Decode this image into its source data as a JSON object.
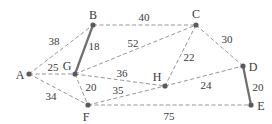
{
  "nodes": [
    {
      "id": "A",
      "x": 29,
      "y": 74,
      "lx": 20,
      "ly": 75
    },
    {
      "id": "B",
      "x": 93,
      "y": 25,
      "lx": 93,
      "ly": 15
    },
    {
      "id": "C",
      "x": 196,
      "y": 25,
      "lx": 196,
      "ly": 14
    },
    {
      "id": "D",
      "x": 243,
      "y": 66,
      "lx": 253,
      "ly": 67
    },
    {
      "id": "E",
      "x": 251,
      "y": 105,
      "lx": 261,
      "ly": 106
    },
    {
      "id": "F",
      "x": 88,
      "y": 105,
      "lx": 86,
      "ly": 117
    },
    {
      "id": "G",
      "x": 75,
      "y": 74,
      "lx": 67,
      "ly": 66
    },
    {
      "id": "H",
      "x": 165,
      "y": 86,
      "lx": 157,
      "ly": 77
    }
  ],
  "edges": [
    {
      "from": "A",
      "to": "B",
      "weight": "38",
      "style": "dashed",
      "lx": 54,
      "ly": 41
    },
    {
      "from": "A",
      "to": "G",
      "weight": "25",
      "style": "dashed",
      "lx": 53,
      "ly": 67
    },
    {
      "from": "A",
      "to": "F",
      "weight": "34",
      "style": "dashed",
      "lx": 51,
      "ly": 96
    },
    {
      "from": "B",
      "to": "G",
      "weight": "18",
      "style": "solid",
      "lx": 94,
      "ly": 46
    },
    {
      "from": "B",
      "to": "C",
      "weight": "40",
      "style": "dashed",
      "lx": 144,
      "ly": 17
    },
    {
      "from": "G",
      "to": "C",
      "weight": "52",
      "style": "dashed",
      "lx": 133,
      "ly": 43
    },
    {
      "from": "G",
      "to": "H",
      "weight": "36",
      "style": "dashed",
      "lx": 122,
      "ly": 73
    },
    {
      "from": "G",
      "to": "F",
      "weight": "20",
      "style": "dashed",
      "lx": 91,
      "ly": 87
    },
    {
      "from": "F",
      "to": "H",
      "weight": "35",
      "style": "dashed",
      "lx": 118,
      "ly": 90
    },
    {
      "from": "C",
      "to": "H",
      "weight": "22",
      "style": "dashed",
      "lx": 189,
      "ly": 57
    },
    {
      "from": "C",
      "to": "D",
      "weight": "30",
      "style": "dashed",
      "lx": 227,
      "ly": 39
    },
    {
      "from": "H",
      "to": "D",
      "weight": "24",
      "style": "dashed",
      "lx": 206,
      "ly": 85
    },
    {
      "from": "D",
      "to": "E",
      "weight": "20",
      "style": "solid",
      "lx": 258,
      "ly": 87
    },
    {
      "from": "F",
      "to": "E",
      "weight": "75",
      "style": "dashed",
      "lx": 169,
      "ly": 116
    }
  ],
  "colors": {
    "node": "#5a5a5a",
    "dashed_edge": "#8a8a8a",
    "solid_edge": "#6e6e6e",
    "text": "#3a3a3a"
  }
}
